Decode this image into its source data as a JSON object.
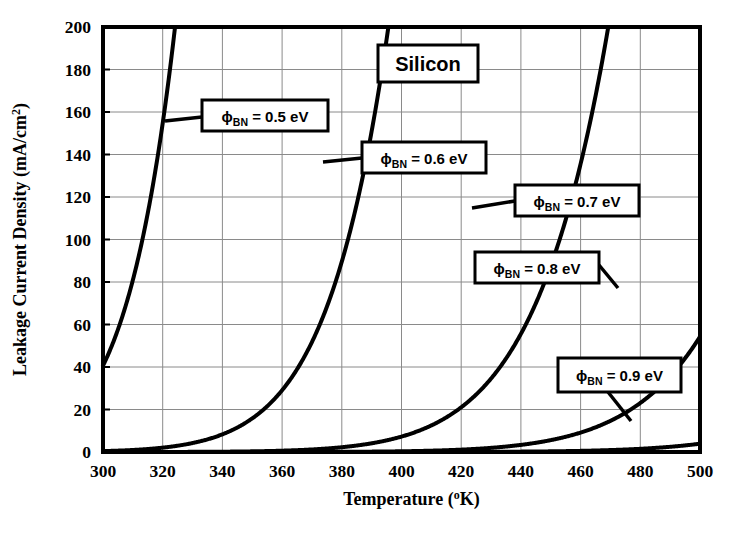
{
  "chart_data": {
    "type": "line",
    "title": "Silicon",
    "xlabel_main": "Temperature",
    "xlabel_units": "(°K)",
    "ylabel": "Leakage Current Density  (mA/cm²)",
    "ylabel_main": "Leakage Current Density",
    "ylabel_units": "(mA/cm",
    "ylabel_exp": "2",
    "ylabel_close": ")",
    "xlim": [
      300,
      500
    ],
    "ylim": [
      0,
      200
    ],
    "xticks": [
      300,
      320,
      340,
      360,
      380,
      400,
      420,
      440,
      460,
      480,
      500
    ],
    "yticks": [
      0,
      20,
      40,
      60,
      80,
      100,
      120,
      140,
      160,
      180,
      200
    ],
    "xtick_labels": [
      "300",
      "320",
      "340",
      "360",
      "380",
      "400",
      "420",
      "440",
      "460",
      "480",
      "500"
    ],
    "ytick_labels": [
      "0",
      "20",
      "40",
      "60",
      "80",
      "100",
      "120",
      "140",
      "160",
      "180",
      "200"
    ],
    "grid": true,
    "legend_position": "inline-callouts",
    "richardson_constant_A": 110,
    "series": [
      {
        "name": "phi_BN = 0.5 eV",
        "barrier_eV": 0.5,
        "label_prefix": "ϕ",
        "label_sub": "BN",
        "label_rest": " = 0.5 eV",
        "points": [
          {
            "x": 300,
            "y": 42
          },
          {
            "x": 305,
            "y": 59
          },
          {
            "x": 310,
            "y": 81
          },
          {
            "x": 315,
            "y": 112
          },
          {
            "x": 320,
            "y": 152
          },
          {
            "x": 323,
            "y": 183
          },
          {
            "x": 325,
            "y": 207
          }
        ]
      },
      {
        "name": "phi_BN = 0.6 eV",
        "barrier_eV": 0.6,
        "label_prefix": "ϕ",
        "label_sub": "BN",
        "label_rest": " = 0.6 eV",
        "points": [
          {
            "x": 300,
            "y": 0.9
          },
          {
            "x": 320,
            "y": 3.3
          },
          {
            "x": 330,
            "y": 6.0
          },
          {
            "x": 340,
            "y": 10.6
          },
          {
            "x": 350,
            "y": 18.1
          },
          {
            "x": 360,
            "y": 30.0
          },
          {
            "x": 365,
            "y": 38.2
          },
          {
            "x": 370,
            "y": 48.3
          },
          {
            "x": 375,
            "y": 60.6
          },
          {
            "x": 380,
            "y": 75.5
          },
          {
            "x": 385,
            "y": 93.4
          },
          {
            "x": 390,
            "y": 114.7
          },
          {
            "x": 395,
            "y": 140.0
          },
          {
            "x": 400,
            "y": 169.8
          },
          {
            "x": 404,
            "y": 197.5
          }
        ]
      },
      {
        "name": "phi_BN = 0.7 eV",
        "barrier_eV": 0.7,
        "label_prefix": "ϕ",
        "label_sub": "BN",
        "label_rest": " = 0.7 eV",
        "points": [
          {
            "x": 300,
            "y": 0.02
          },
          {
            "x": 340,
            "y": 0.26
          },
          {
            "x": 360,
            "y": 0.93
          },
          {
            "x": 380,
            "y": 2.9
          },
          {
            "x": 400,
            "y": 8.0
          },
          {
            "x": 410,
            "y": 12.9
          },
          {
            "x": 420,
            "y": 20.3
          },
          {
            "x": 430,
            "y": 31.3
          },
          {
            "x": 440,
            "y": 47.2
          },
          {
            "x": 445,
            "y": 57.5
          },
          {
            "x": 450,
            "y": 69.7
          },
          {
            "x": 455,
            "y": 84.0
          },
          {
            "x": 460,
            "y": 100.7
          },
          {
            "x": 465,
            "y": 120.1
          },
          {
            "x": 470,
            "y": 142.6
          },
          {
            "x": 475,
            "y": 168.5
          },
          {
            "x": 480,
            "y": 198.2
          }
        ]
      },
      {
        "name": "phi_BN = 0.8 eV",
        "barrier_eV": 0.8,
        "label_prefix": "ϕ",
        "label_sub": "BN",
        "label_rest": " = 0.8 eV",
        "points": [
          {
            "x": 300,
            "y": 0.0005
          },
          {
            "x": 360,
            "y": 0.03
          },
          {
            "x": 400,
            "y": 0.35
          },
          {
            "x": 420,
            "y": 1.05
          },
          {
            "x": 440,
            "y": 2.9
          },
          {
            "x": 455,
            "y": 6.0
          },
          {
            "x": 465,
            "y": 9.4
          },
          {
            "x": 475,
            "y": 14.3
          },
          {
            "x": 485,
            "y": 21.2
          },
          {
            "x": 490,
            "y": 25.6
          },
          {
            "x": 495,
            "y": 30.8
          },
          {
            "x": 500,
            "y": 36.8
          }
        ]
      },
      {
        "name": "phi_BN = 0.9 eV",
        "barrier_eV": 0.9,
        "label_prefix": "ϕ",
        "label_sub": "BN",
        "label_rest": " = 0.9 eV",
        "points": [
          {
            "x": 300,
            "y": 1e-05
          },
          {
            "x": 400,
            "y": 0.014
          },
          {
            "x": 440,
            "y": 0.12
          },
          {
            "x": 460,
            "y": 0.33
          },
          {
            "x": 480,
            "y": 0.84
          },
          {
            "x": 500,
            "y": 2.0
          }
        ]
      }
    ],
    "callouts": [
      {
        "id": "phi-05",
        "prefix": "ϕ",
        "sub": "BN",
        "rest": " = 0.5 eV",
        "box": {
          "x": 202,
          "y": 100,
          "w": 126,
          "h": 31
        },
        "leader": [
          [
            202,
            117
          ],
          [
            165,
            121
          ]
        ]
      },
      {
        "id": "phi-06",
        "prefix": "ϕ",
        "sub": "BN",
        "rest": " = 0.6 eV",
        "box": {
          "x": 362,
          "y": 142,
          "w": 124,
          "h": 31
        },
        "leader": [
          [
            362,
            158
          ],
          [
            323,
            162
          ]
        ]
      },
      {
        "id": "phi-07",
        "prefix": "ϕ",
        "sub": "BN",
        "rest": " = 0.7 eV",
        "box": {
          "x": 515,
          "y": 185,
          "w": 124,
          "h": 31
        },
        "leader": [
          [
            515,
            201
          ],
          [
            472,
            208
          ]
        ]
      },
      {
        "id": "phi-08",
        "prefix": "ϕ",
        "sub": "BN",
        "rest": " = 0.8 eV",
        "box": {
          "x": 475,
          "y": 252,
          "w": 124,
          "h": 31
        },
        "leader": [
          [
            599,
            265
          ],
          [
            618,
            288
          ]
        ]
      },
      {
        "id": "phi-09",
        "prefix": "ϕ",
        "sub": "BN",
        "rest": " = 0.9 eV",
        "box": {
          "x": 558,
          "y": 358,
          "w": 123,
          "h": 34
        },
        "leader": [
          [
            608,
            392
          ],
          [
            631,
            421
          ]
        ]
      }
    ],
    "title_box": {
      "x": 378,
      "y": 45,
      "w": 100,
      "h": 37
    }
  },
  "colors": {
    "curve": "#000000",
    "grid": "#8a8a8a",
    "frame": "#000000",
    "background": "#ffffff",
    "text": "#000000"
  }
}
